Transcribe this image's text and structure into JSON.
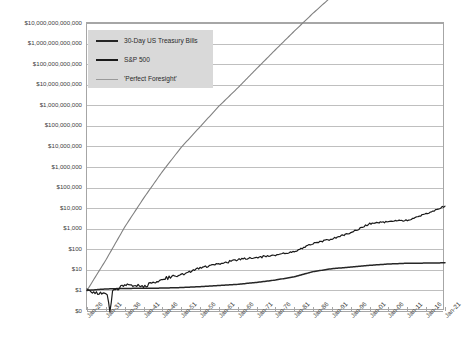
{
  "chart_data": {
    "type": "line",
    "title": "",
    "xlabel": "",
    "ylabel": "",
    "scale": "log",
    "grid": true,
    "legend_position": "top-left",
    "ylim": [
      1,
      10000000000000
    ],
    "ytick_labels": [
      "$10,000,000,000,000",
      "$1,000,000,000,000",
      "$100,000,000,000",
      "$10,000,000,000",
      "$1,000,000,000",
      "$100,000,000",
      "$10,000,000",
      "$1,000,000",
      "$100,000",
      "$10,000",
      "$1,000",
      "$100",
      "$10",
      "$1",
      "$0"
    ],
    "ytick_values": [
      10000000000000.0,
      1000000000000.0,
      100000000000.0,
      10000000000.0,
      1000000000.0,
      100000000.0,
      10000000.0,
      1000000.0,
      100000.0,
      10000.0,
      1000.0,
      100,
      10,
      1,
      0
    ],
    "categories": [
      "Jan-26",
      "Jan-31",
      "Jan-36",
      "Jan-41",
      "Jan-46",
      "Jan-51",
      "Jan-56",
      "Jan-61",
      "Jan-66",
      "Jan-71",
      "Jan-76",
      "Jan-81",
      "Jan-86",
      "Jan-91",
      "Jan-96",
      "Jan-01",
      "Jan-06",
      "Jan-11",
      "Jan-16",
      "Jan-21"
    ],
    "x_start_year": 1926,
    "x_end_year": 2021,
    "series": [
      {
        "name": "30-Day US Treasury Bills",
        "color": "#262626",
        "legend_swatch_color": "#262626",
        "x": [
          1926,
          1931,
          1936,
          1941,
          1946,
          1951,
          1956,
          1961,
          1966,
          1971,
          1976,
          1981,
          1986,
          1991,
          1996,
          2001,
          2006,
          2011,
          2016,
          2021
        ],
        "values": [
          1.0,
          1.18,
          1.25,
          1.27,
          1.3,
          1.38,
          1.52,
          1.74,
          1.98,
          2.45,
          3.2,
          4.6,
          8.2,
          11.4,
          13.6,
          16.6,
          19.2,
          21.0,
          21.3,
          22.0
        ]
      },
      {
        "name": "S&P 500",
        "color": "#1a1a1a",
        "legend_swatch_color": "#1a1a1a",
        "x": [
          1926,
          1931,
          1936,
          1941,
          1946,
          1951,
          1956,
          1961,
          1966,
          1971,
          1976,
          1981,
          1986,
          1991,
          1996,
          2001,
          2006,
          2011,
          2016,
          2021
        ],
        "values": [
          1.0,
          0.62,
          1.8,
          1.55,
          3.6,
          5.6,
          12.5,
          19.5,
          31.0,
          40.0,
          52.0,
          78.0,
          190.0,
          320.0,
          640.0,
          1750.0,
          2200.0,
          2600.0,
          5400.0,
          12500.0
        ]
      },
      {
        "name": "'Perfect Foresight'",
        "color": "#808080",
        "legend_swatch_color": "#9a9a9a",
        "x": [
          1926,
          1931,
          1936,
          1941,
          1946,
          1951,
          1956,
          1961,
          1966,
          1971,
          1976,
          1981,
          1986,
          1991,
          1996,
          2001,
          2006,
          2011,
          2016,
          2021
        ],
        "values": [
          1.0,
          30.0,
          1200.0,
          30000.0,
          600000.0,
          9000000.0,
          90000000.0,
          900000000.0,
          7000000000.0,
          60000000000.0,
          500000000000.0,
          4000000000000.0,
          30000000000000.0,
          200000000000000.0,
          1500000000000000.0,
          1.2e+16,
          7e+16,
          4e+17,
          2e+18,
          1.2e+19
        ]
      }
    ],
    "legend_entries": [
      "30-Day US Treasury Bills",
      "S&P 500",
      "'Perfect Foresight'"
    ]
  },
  "colors": {
    "grid": "#bfbfbf",
    "frame": "#a6a6a6",
    "legend_bg": "#d9d9d9",
    "text": "#404040"
  }
}
